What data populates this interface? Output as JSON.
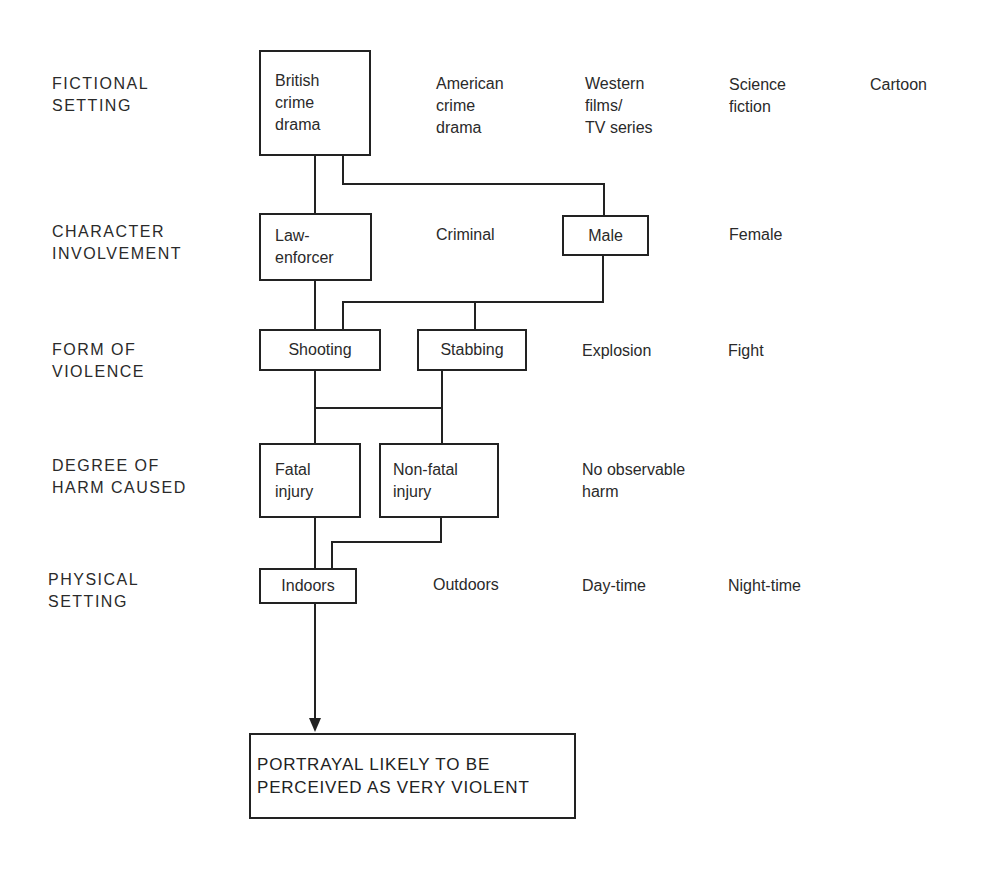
{
  "rows": [
    {
      "label": "FICTIONAL\nSETTING",
      "selected": [
        "British\ncrime\ndrama"
      ],
      "options": [
        "American\ncrime\ndrama",
        "Western\nfilms/\nTV series",
        "Science\nfiction",
        "Cartoon"
      ]
    },
    {
      "label": "CHARACTER\nINVOLVEMENT",
      "selected": [
        "Law-\nenforcer",
        "Male"
      ],
      "options": [
        "Criminal",
        "Female"
      ]
    },
    {
      "label": "FORM OF\nVIOLENCE",
      "selected": [
        "Shooting",
        "Stabbing"
      ],
      "options": [
        "Explosion",
        "Fight"
      ]
    },
    {
      "label": "DEGREE OF\nHARM CAUSED",
      "selected": [
        "Fatal\ninjury",
        "Non-fatal\ninjury"
      ],
      "options": [
        "No observable\nharm"
      ]
    },
    {
      "label": "PHYSICAL\nSETTING",
      "selected": [
        "Indoors"
      ],
      "options": [
        "Outdoors",
        "Day-time",
        "Night-time"
      ]
    }
  ],
  "outcome": "PORTRAYAL LIKELY TO BE\nPERCEIVED AS VERY VIOLENT",
  "colors": {
    "line": "#222222",
    "text": "#2a2a2a",
    "background": "#ffffff"
  }
}
